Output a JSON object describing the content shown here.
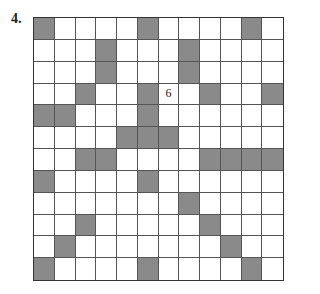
{
  "puzzle_label": "4.",
  "grid": {
    "rows": 12,
    "cols": 12,
    "shade_color": "#8a8a8a",
    "shaded": [
      [
        1,
        1
      ],
      [
        1,
        6
      ],
      [
        1,
        11
      ],
      [
        2,
        4
      ],
      [
        2,
        8
      ],
      [
        3,
        4
      ],
      [
        3,
        8
      ],
      [
        4,
        3
      ],
      [
        4,
        6
      ],
      [
        4,
        9
      ],
      [
        4,
        12
      ],
      [
        5,
        1
      ],
      [
        5,
        2
      ],
      [
        5,
        6
      ],
      [
        6,
        5
      ],
      [
        6,
        6
      ],
      [
        6,
        7
      ],
      [
        7,
        3
      ],
      [
        7,
        4
      ],
      [
        7,
        9
      ],
      [
        7,
        10
      ],
      [
        7,
        11
      ],
      [
        7,
        12
      ],
      [
        8,
        1
      ],
      [
        8,
        6
      ],
      [
        9,
        8
      ],
      [
        10,
        3
      ],
      [
        10,
        9
      ],
      [
        11,
        2
      ],
      [
        11,
        10
      ],
      [
        12,
        1
      ],
      [
        12,
        6
      ],
      [
        12,
        11
      ]
    ],
    "clues": [
      {
        "row": 4,
        "col": 7,
        "value": "6"
      }
    ]
  }
}
